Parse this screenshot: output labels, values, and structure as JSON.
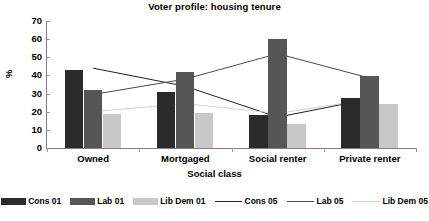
{
  "chart_data": {
    "type": "bar",
    "title": "Voter profile: housing tenure",
    "xlabel": "Social class",
    "ylabel": "%",
    "categories": [
      "Owned",
      "Mortgaged",
      "Social renter",
      "Private renter"
    ],
    "ylim": [
      0,
      70
    ],
    "yticks": [
      0,
      10,
      20,
      30,
      40,
      50,
      60,
      70
    ],
    "grid": false,
    "legend_position": "bottom",
    "bar_series": [
      {
        "name": "Cons 01",
        "color": "#2b2b2b",
        "values": [
          43,
          31,
          18,
          27.5
        ]
      },
      {
        "name": "Lab 01",
        "color": "#565656",
        "values": [
          32,
          42,
          60,
          39.5
        ]
      },
      {
        "name": "Lib Dem 01",
        "color": "#c8c8c8",
        "values": [
          19,
          19.5,
          13.5,
          24
        ]
      }
    ],
    "line_series": [
      {
        "name": "Cons 05",
        "color": "#1f1f1f",
        "values": [
          44,
          34,
          17,
          27
        ]
      },
      {
        "name": "Lab 05",
        "color": "#4a4a4a",
        "values": [
          29.5,
          38,
          52,
          38.5
        ]
      },
      {
        "name": "Lib Dem 05",
        "color": "#d2d2d2",
        "values": [
          20,
          24.5,
          19,
          27
        ]
      }
    ]
  }
}
